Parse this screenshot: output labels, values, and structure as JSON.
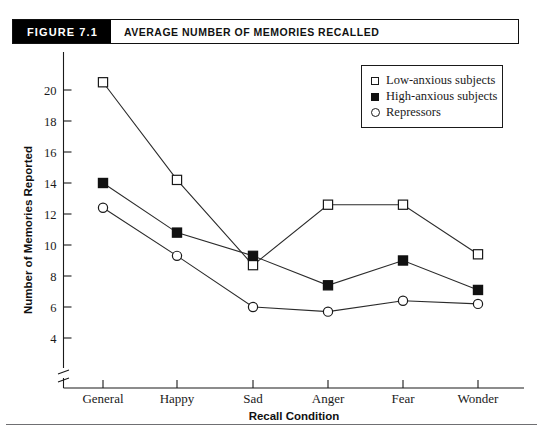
{
  "figure": {
    "number_label": "FIGURE  7.1",
    "title": "AVERAGE NUMBER OF MEMORIES RECALLED"
  },
  "legend": {
    "position": "top-right-inside",
    "entries": [
      {
        "marker": "open-square",
        "label": "Low-anxious subjects"
      },
      {
        "marker": "filled-square",
        "label": "High-anxious subjects"
      },
      {
        "marker": "open-circle",
        "label": "Repressors"
      }
    ]
  },
  "chart_data": {
    "type": "line",
    "title": "AVERAGE NUMBER OF MEMORIES RECALLED",
    "xlabel": "Recall Condition",
    "ylabel": "Number of Memories Reported",
    "categories": [
      "General",
      "Happy",
      "Sad",
      "Anger",
      "Fear",
      "Wonder"
    ],
    "ylim": [
      3.4,
      21.0
    ],
    "yticks": [
      4,
      6,
      8,
      10,
      12,
      14,
      16,
      18,
      20
    ],
    "ytick_labels": [
      "4",
      "6",
      "8",
      "10",
      "12",
      "14",
      "16",
      "18",
      "20"
    ],
    "axis_break": true,
    "grid": false,
    "series": [
      {
        "name": "Low-anxious subjects",
        "marker": "open-square",
        "values": [
          20.5,
          14.2,
          8.7,
          12.6,
          12.6,
          9.4
        ]
      },
      {
        "name": "High-anxious subjects",
        "marker": "filled-square",
        "values": [
          14.0,
          10.8,
          9.3,
          7.4,
          9.0,
          7.1
        ]
      },
      {
        "name": "Repressors",
        "marker": "open-circle",
        "values": [
          12.4,
          9.3,
          6.0,
          5.7,
          6.4,
          6.2
        ]
      }
    ]
  },
  "colors": {
    "ink": "#1a1a1a",
    "header_bg": "#000000",
    "header_fg": "#ffffff",
    "page_bg": "#ffffff"
  }
}
